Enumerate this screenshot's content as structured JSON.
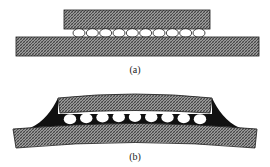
{
  "figure": {
    "panels": [
      {
        "id": "a",
        "label": "(a)",
        "description": "Flip-chip die on substrate, flat, with solder bumps",
        "bump_count": 10
      },
      {
        "id": "b",
        "label": "(b)",
        "description": "Warped assembly with underfill encapsulant fillets",
        "bump_count": 9
      }
    ],
    "colors": {
      "hatch_fill": "#8a8a8a",
      "hatch_dark": "#3a3a3a",
      "underfill": "#111111",
      "outline": "#1a1a1a",
      "bump": "#ffffff"
    }
  }
}
